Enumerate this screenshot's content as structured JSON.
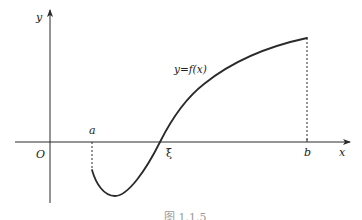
{
  "diagram": {
    "type": "function-graph",
    "curve_label": "y=f(x)",
    "axes": {
      "x_label": "x",
      "y_label": "y",
      "origin_label": "O"
    },
    "points": {
      "a_label": "a",
      "b_label": "b",
      "xi_label": "ξ"
    },
    "caption": "图 1.1.5",
    "colors": {
      "stroke": "#2a2a2a",
      "background": "#ffffff"
    }
  }
}
